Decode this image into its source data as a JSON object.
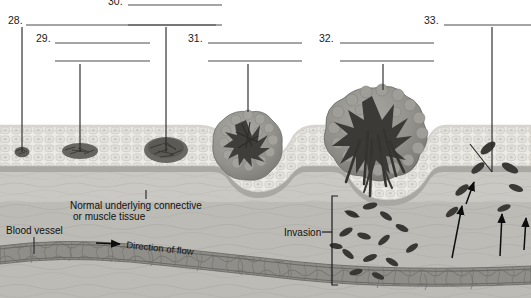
{
  "figure": {
    "kind": "labeled biology diagram with blank answer lines",
    "width": 531,
    "height": 298
  },
  "numbered_labels": [
    {
      "id": "28",
      "number": "28.",
      "x": 8,
      "y": 24,
      "line_x1": 26,
      "line_x2": 216,
      "line_y": 25,
      "leader_x": 22,
      "leader_y1": 27,
      "leader_y2": 152,
      "second_line": null
    },
    {
      "id": "29",
      "number": "29.",
      "x": 36,
      "y": 42,
      "line_x1": 55,
      "line_x2": 150,
      "line_y": 43,
      "leader_x": 80,
      "leader_y1": 62,
      "leader_y2": 152,
      "second_line": {
        "x1": 55,
        "x2": 150,
        "y": 61
      }
    },
    {
      "id": "30",
      "number": "30.",
      "x": 108,
      "y": 4,
      "line_x1": 128,
      "line_x2": 222,
      "line_y": 5,
      "leader_x": 166,
      "leader_y1": 26,
      "leader_y2": 152,
      "second_line": {
        "x1": 128,
        "x2": 222,
        "y": 25
      }
    },
    {
      "id": "31",
      "number": "31.",
      "x": 188,
      "y": 42,
      "line_x1": 208,
      "line_x2": 302,
      "line_y": 43,
      "leader_x": 248,
      "leader_y1": 62,
      "leader_y2": 112,
      "second_line": {
        "x1": 208,
        "x2": 302,
        "y": 61
      }
    },
    {
      "id": "32",
      "number": "32.",
      "x": 319,
      "y": 42,
      "line_x1": 340,
      "line_x2": 434,
      "line_y": 43,
      "leader_x": 383,
      "leader_y1": 62,
      "leader_y2": 90,
      "second_line": {
        "x1": 340,
        "x2": 434,
        "y": 61
      }
    },
    {
      "id": "33",
      "number": "33.",
      "x": 424,
      "y": 24,
      "line_x1": 444,
      "line_x2": 531,
      "line_y": 25,
      "leader_x": 492,
      "leader_y1": 27,
      "leader_y2": 172,
      "second_line": null
    }
  ],
  "annotations": {
    "connective_tissue": {
      "line1": "Normal underlying connective",
      "line2": "or muscle tissue",
      "x": 70,
      "y": 205,
      "tick_x": 146,
      "tick_y1": 190,
      "tick_y2": 199
    },
    "blood_vessel": {
      "text": "Blood vessel",
      "x": 6,
      "y": 232,
      "leader_x": 34,
      "leader_y1": 235,
      "leader_y2": 252
    },
    "invasion": {
      "text": "Invasion",
      "x": 284,
      "y": 236,
      "leader_x1": 322,
      "leader_x2": 330,
      "leader_y": 232,
      "bracket_x": 330,
      "bracket_y1": 196,
      "bracket_y2": 285,
      "bracket_tick": 6
    },
    "direction_of_flow": {
      "text": "Direction of flow",
      "x": 123,
      "y": 245,
      "rotate": -6,
      "arrow_x1": 96,
      "arrow_x2": 120,
      "arrow_y": 243
    }
  },
  "tissue_layers": [
    {
      "name": "epithelium",
      "fill": "#e8e7e2"
    },
    {
      "name": "basement-membrane",
      "fill": "#b2b1ac"
    },
    {
      "name": "connective-tissue",
      "fill": "#c8c7c2"
    },
    {
      "name": "deep-stroma",
      "fill": "#b6b5b0"
    },
    {
      "name": "blood-vessel",
      "fill": "#8e8d88"
    }
  ],
  "tumor_masses": [
    {
      "name": "single-transformed-cell",
      "cx": 22,
      "cy": 152,
      "rx": 7,
      "ry": 5,
      "stage": "28"
    },
    {
      "name": "small-dysplastic-cluster",
      "cx": 80,
      "cy": 151,
      "rx": 17,
      "ry": 8,
      "stage": "29"
    },
    {
      "name": "carcinoma-in-situ-mass",
      "cx": 166,
      "cy": 150,
      "rx": 21,
      "ry": 12,
      "stage": "30"
    },
    {
      "name": "invasive-tumor-nodule",
      "cx": 250,
      "cy": 146,
      "rx": 34,
      "ry": 32,
      "stage": "31"
    },
    {
      "name": "large-invasive-tumor",
      "cx": 375,
      "cy": 138,
      "rx": 52,
      "ry": 48,
      "stage": "32"
    }
  ],
  "colors": {
    "page_background": "#ffffff",
    "answer_line": "#4a4a4a",
    "leader_line": "#2a2a2a",
    "text": "#1b1b1b",
    "tumor_light": "#9b9a95",
    "tumor_dark": "#4e4d49",
    "vessel": "#8e8d88"
  }
}
